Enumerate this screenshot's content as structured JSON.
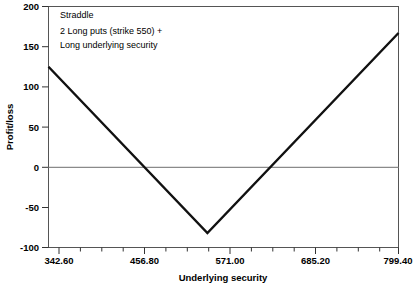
{
  "chart_data": {
    "type": "line",
    "title": "",
    "xlabel": "Underlying security",
    "ylabel": "Profit/loss",
    "xlim": [
      342.6,
      799.4
    ],
    "ylim": [
      -100,
      200
    ],
    "grid": false,
    "legend": "none",
    "x_ticks": [
      342.6,
      456.8,
      571.0,
      685.2,
      799.4
    ],
    "x_tick_labels": [
      "342.60",
      "456.80",
      "571.00",
      "685.20",
      "799.40"
    ],
    "x_minor_tick_count_between": 3,
    "y_ticks": [
      -100,
      -50,
      0,
      50,
      100,
      150,
      200
    ],
    "y_tick_labels": [
      "-100",
      "-50",
      "0",
      "50",
      "100",
      "150",
      "200"
    ],
    "zero_reference_line": 0,
    "series": [
      {
        "name": "Straddle payoff",
        "color": "#111111",
        "x": [
          342.6,
          550.0,
          799.4
        ],
        "values": [
          125,
          -82,
          167
        ]
      }
    ],
    "annotations": [
      "Straddle",
      "2 Long puts (strike 550) +",
      "Long underlying security"
    ],
    "breakeven_points": [
      468,
      632
    ],
    "vertex": {
      "x": 550.0,
      "y": -82
    }
  },
  "colors": {
    "line": "#111111",
    "frame": "#555555",
    "zero_line": "#8a8a8a",
    "text": "#000000",
    "background": "#ffffff"
  }
}
